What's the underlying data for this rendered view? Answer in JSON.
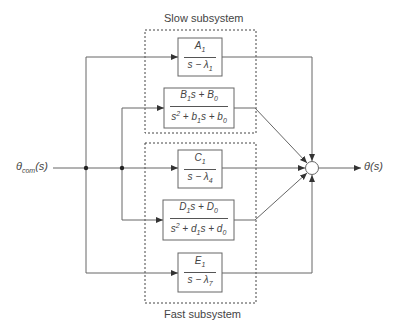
{
  "diagram": {
    "input_label": "θcom(s)",
    "output_label": "θ(s)",
    "groups": {
      "slow": "Slow subsystem",
      "fast": "Fast subsystem"
    },
    "blocks": [
      {
        "id": "A",
        "num": "A1",
        "den": "s − λ1"
      },
      {
        "id": "B",
        "num": "B1s + B0",
        "den": "s2 + b1s + b0"
      },
      {
        "id": "C",
        "num": "C1",
        "den": "s − λ4"
      },
      {
        "id": "D",
        "num": "D1s + D0",
        "den": "s2 + d1s + d0"
      },
      {
        "id": "E",
        "num": "E1",
        "den": "s − λ7"
      }
    ],
    "summing_junction": "sum"
  }
}
